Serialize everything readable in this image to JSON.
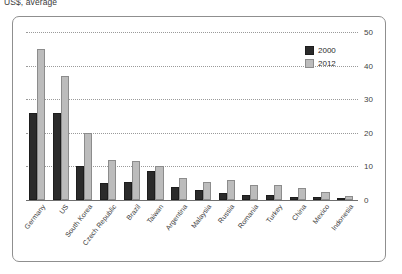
{
  "page": {
    "title": "US$, average"
  },
  "chart_data": {
    "type": "bar",
    "title": "US$, average",
    "xlabel": "",
    "ylabel": "",
    "ylim": [
      0,
      50
    ],
    "yticks": [
      0,
      10,
      20,
      30,
      40,
      50
    ],
    "grid": true,
    "y_axis_position": "right",
    "legend_position": "top-right",
    "categories": [
      "Germany",
      "US",
      "South Korea",
      "Czech Republic",
      "Brazil",
      "Taiwan",
      "Argentina",
      "Malaysia",
      "Russia",
      "Romania",
      "Turkey",
      "China",
      "Mexico",
      "Indonesia"
    ],
    "series": [
      {
        "name": "2000",
        "color": "#2b2b2b",
        "values": [
          26,
          26,
          10,
          5,
          5.5,
          8.5,
          4,
          3,
          2,
          1.5,
          1.5,
          1,
          1,
          0.4
        ]
      },
      {
        "name": "2012",
        "color": "#bcbcbc",
        "values": [
          45,
          37,
          20,
          12,
          11.5,
          10,
          6.5,
          5.5,
          6,
          4.5,
          4.5,
          3.5,
          2.5,
          1.2
        ]
      }
    ]
  }
}
